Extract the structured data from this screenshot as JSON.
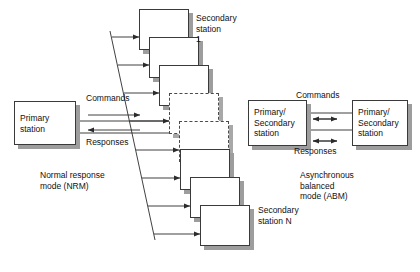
{
  "diagram": {
    "colors": {
      "box_fill": "#ffffff",
      "box_border": "#3a3a3a",
      "shadow": "#9d9d9d",
      "line": "#2b2b2b",
      "text": "#111111"
    }
  },
  "nrm": {
    "primary_station": {
      "label": "Primary\nstation"
    },
    "commands_label": "Commands",
    "responses_label": "Responses",
    "caption": "Normal response\nmode (NRM)",
    "secondary_first_label": "Secondary\nstation\n1",
    "secondary_last_label": "Secondary\nstation N",
    "secondary_stations": [
      {
        "id": 1,
        "style": "solid",
        "x": 139,
        "y": 9,
        "w": 50,
        "h": 41
      },
      {
        "id": 2,
        "style": "solid",
        "x": 149,
        "y": 37,
        "w": 50,
        "h": 41
      },
      {
        "id": 3,
        "style": "solid",
        "x": 159,
        "y": 65,
        "w": 50,
        "h": 41
      },
      {
        "id": 4,
        "style": "dashed",
        "x": 169,
        "y": 93,
        "w": 50,
        "h": 41
      },
      {
        "id": 5,
        "style": "dashed",
        "x": 179,
        "y": 121,
        "w": 50,
        "h": 41
      },
      {
        "id": 6,
        "style": "solid",
        "x": 180,
        "y": 149,
        "w": 50,
        "h": 41
      },
      {
        "id": 7,
        "style": "solid",
        "x": 190,
        "y": 177,
        "w": 50,
        "h": 41
      },
      {
        "id": 8,
        "style": "solid",
        "x": 200,
        "y": 205,
        "w": 50,
        "h": 41
      }
    ],
    "branch_arrows": [
      {
        "y": 37,
        "x_from": 113,
        "x_to": 139
      },
      {
        "y": 65,
        "x_from": 118,
        "x_to": 149
      },
      {
        "y": 93,
        "x_from": 123,
        "x_to": 159
      },
      {
        "y": 121,
        "x_from": 80,
        "x_to": 169
      },
      {
        "y": 150,
        "x_from": 133,
        "x_to": 179
      },
      {
        "y": 178,
        "x_from": 138,
        "x_to": 180
      },
      {
        "y": 206,
        "x_from": 143,
        "x_to": 190
      },
      {
        "y": 234,
        "x_from": 148,
        "x_to": 200
      }
    ]
  },
  "abm": {
    "left_station": {
      "label": "Primary/\nSecondary\nstation"
    },
    "right_station": {
      "label": "Primary/\nSecondary\nstation"
    },
    "commands_label": "Commands",
    "responses_label": "Responses",
    "caption": "Asynchronous\nbalanced\nmode (ABM)"
  }
}
